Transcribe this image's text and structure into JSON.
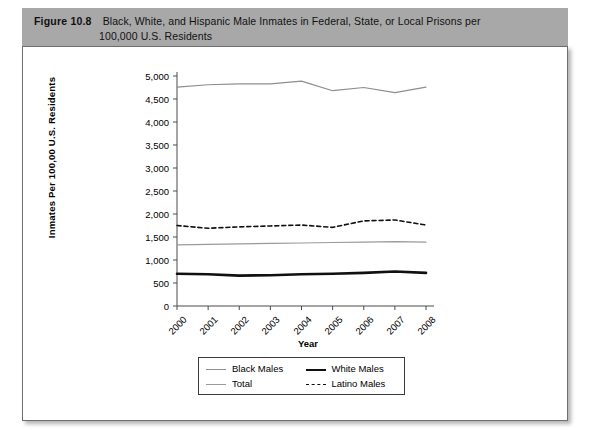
{
  "header": {
    "figure_number": "Figure 10.8",
    "title_line_1": "Black, White, and Hispanic Male Inmates in Federal, State, or Local Prisons per",
    "title_line_2": "100,000 U.S. Residents"
  },
  "chart_data": {
    "type": "line",
    "title": "Black, White, and Hispanic Male Inmates in Federal, State, or Local Prisons per 100,000 U.S. Residents",
    "xlabel": "Year",
    "ylabel": "Inmates Per 100,00 U.S. Residents",
    "categories": [
      "2000",
      "2001",
      "2002",
      "2003",
      "2004",
      "2005",
      "2006",
      "2007",
      "2008"
    ],
    "x": [
      2000,
      2001,
      2002,
      2003,
      2004,
      2005,
      2006,
      2007,
      2008
    ],
    "ylim": [
      0,
      5000
    ],
    "yticks": [
      "0",
      "500",
      "1,000",
      "1,500",
      "2,000",
      "2,500",
      "3,000",
      "3,500",
      "4,000",
      "4,500",
      "5,000"
    ],
    "ytick_values": [
      0,
      500,
      1000,
      1500,
      2000,
      2500,
      3000,
      3500,
      4000,
      4500,
      5000
    ],
    "grid": false,
    "legend_position": "below-axes",
    "series": [
      {
        "name": "Black Males",
        "style": "thin-gray",
        "color": "#8e8e8e",
        "values": [
          4760,
          4810,
          4830,
          4830,
          4890,
          4680,
          4750,
          4640,
          4760
        ]
      },
      {
        "name": "White Males",
        "style": "thick-black",
        "color": "#101010",
        "values": [
          700,
          690,
          660,
          670,
          690,
          700,
          720,
          750,
          720
        ]
      },
      {
        "name": "Total",
        "style": "thin-gray",
        "color": "#9a9a9a",
        "values": [
          1330,
          1340,
          1350,
          1360,
          1370,
          1380,
          1390,
          1400,
          1390
        ]
      },
      {
        "name": "Latino Males",
        "style": "dashed-black",
        "color": "#101010",
        "values": [
          1750,
          1690,
          1720,
          1740,
          1760,
          1710,
          1850,
          1870,
          1760
        ]
      }
    ]
  },
  "legend": {
    "entries": [
      {
        "label": "Black Males"
      },
      {
        "label": "White Males"
      },
      {
        "label": "Total"
      },
      {
        "label": "Latino Males"
      }
    ]
  }
}
